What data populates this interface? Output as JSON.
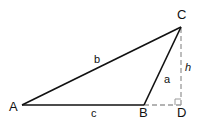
{
  "diagram": {
    "type": "triangle-with-altitude",
    "vertices": {
      "A": {
        "label": "A",
        "x": 22,
        "y": 105
      },
      "B": {
        "label": "B",
        "x": 144,
        "y": 105
      },
      "C": {
        "label": "C",
        "x": 181,
        "y": 27
      },
      "D": {
        "label": "D",
        "x": 181,
        "y": 105
      }
    },
    "sides": {
      "a": {
        "label": "a",
        "from": "B",
        "to": "C"
      },
      "b": {
        "label": "b",
        "from": "A",
        "to": "C"
      },
      "c": {
        "label": "c",
        "from": "A",
        "to": "B"
      }
    },
    "altitude": {
      "label": "h",
      "from": "C",
      "to": "D",
      "style": "dashed"
    },
    "extension": {
      "from": "B",
      "to": "D",
      "style": "dashed"
    },
    "right_angle_at": "D",
    "colors": {
      "solid_line": "#111111",
      "dashed_line": "#9a9a9a",
      "text": "#111111"
    }
  }
}
